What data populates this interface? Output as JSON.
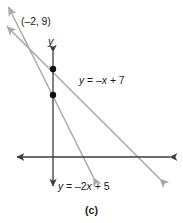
{
  "figure": {
    "caption": "(c)",
    "axis_label_y": "y",
    "point_label": "(–2, 9)",
    "equation_1": "y = –x + 7",
    "equation_2": "y = –2x + 5",
    "colors": {
      "axis": "#3b3b3b",
      "line": "#a8a8a8",
      "point": "#111111",
      "text": "#1a1a1a",
      "background": "#ffffff"
    }
  },
  "chart_data": {
    "type": "line",
    "title": "",
    "xlabel": "",
    "ylabel": "y",
    "grid": false,
    "legend": "none",
    "xlim": [
      -6,
      11
    ],
    "ylim": [
      -7,
      12
    ],
    "annotations": [
      {
        "text": "(–2, 9)",
        "x": -2,
        "y": 9,
        "note": "intersection point of the two lines"
      },
      {
        "text": "y = –x + 7",
        "x": 3.5,
        "y": 4.5,
        "note": "label for shallower line"
      },
      {
        "text": "y = –2x + 5",
        "x": 1.5,
        "y": -5.5,
        "note": "label for steeper line"
      }
    ],
    "points": [
      {
        "label": "y-intercept of y = –x + 7",
        "x": 0,
        "y": 7
      },
      {
        "label": "y-intercept of y = –2x + 5",
        "x": 0,
        "y": 5
      }
    ],
    "series": [
      {
        "name": "y = –x + 7",
        "equation": "y = -x + 7",
        "slope": -1,
        "intercept": 7,
        "arrows": "both",
        "x": [
          -5,
          10
        ],
        "values": [
          12,
          -3
        ]
      },
      {
        "name": "y = –2x + 5",
        "equation": "y = -2x + 5",
        "slope": -2,
        "intercept": 5,
        "arrows": "both",
        "x": [
          -3.5,
          5
        ],
        "values": [
          12,
          -5
        ]
      }
    ],
    "intersection": {
      "x": -2,
      "y": 9
    }
  }
}
